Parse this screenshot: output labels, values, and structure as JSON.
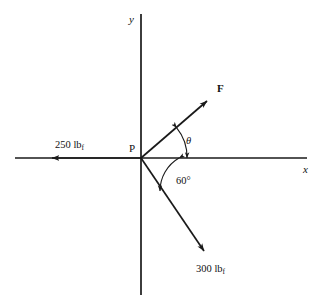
{
  "figure": {
    "type": "free-body-force-diagram",
    "background_color": "#ffffff",
    "line_color": "#1a1a1a",
    "canvas": {
      "width": 323,
      "height": 301
    },
    "origin": {
      "label": "P",
      "x": 141,
      "y": 158
    },
    "axes": {
      "x_label": "x",
      "y_label": "y",
      "x_start": {
        "x": 15,
        "y": 158
      },
      "x_end": {
        "x": 307,
        "y": 158
      },
      "y_start": {
        "x": 141,
        "y": 14
      },
      "y_end": {
        "x": 141,
        "y": 295
      }
    },
    "vectors": [
      {
        "name": "force-250",
        "label": "250 lb",
        "label_subscript": "f",
        "magnitude": 250,
        "unit": "lbf",
        "direction_deg": 180,
        "tail": {
          "x": 141,
          "y": 158
        },
        "tip": {
          "x": 48,
          "y": 158
        },
        "label_x": 75,
        "label_y": 146
      },
      {
        "name": "force-F",
        "label": "F",
        "bold": true,
        "direction_deg": 41,
        "tail": {
          "x": 141,
          "y": 158
        },
        "tip": {
          "x": 211,
          "y": 97
        },
        "label_x": 220,
        "label_y": 90
      },
      {
        "name": "force-300",
        "label": "300 lb",
        "label_subscript": "f",
        "magnitude": 300,
        "unit": "lbf",
        "direction_deg": -60,
        "tail": {
          "x": 141,
          "y": 158
        },
        "tip": {
          "x": 208,
          "y": 256
        },
        "label_x": 197,
        "label_y": 271
      }
    ],
    "angles": [
      {
        "name": "theta",
        "label": "θ",
        "between": [
          "force-F",
          "x-axis-positive"
        ],
        "value_deg": null,
        "arc_radius": 46,
        "label_x": 185,
        "label_y": 142
      },
      {
        "name": "sixty-degrees",
        "label": "60°",
        "between": [
          "x-axis-positive",
          "force-300"
        ],
        "value_deg": 60,
        "arc_radius": 38,
        "label_x": 178,
        "label_y": 182
      }
    ]
  }
}
